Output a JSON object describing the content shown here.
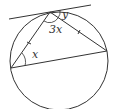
{
  "diagram": {
    "type": "circle-geometry",
    "labels": {
      "angle_tangent": "y",
      "angle_top": "3x",
      "angle_left": "x"
    },
    "colors": {
      "stroke": "#333333",
      "background": "#ffffff"
    },
    "equal_sides_marked": 2
  }
}
